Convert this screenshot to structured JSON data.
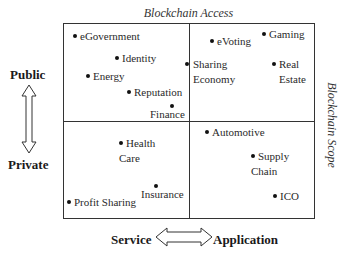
{
  "diagram": {
    "top_title": "Blockchain Access",
    "right_title": "Blockchain Scope",
    "vertical_axis": {
      "top": "Public",
      "bottom": "Private",
      "arrow": "double-vertical-arrow"
    },
    "horizontal_axis": {
      "left": "Service",
      "right": "Application",
      "arrow": "double-horizontal-arrow"
    },
    "quadrants": {
      "public_service": [
        "eGovernment",
        "Identity",
        "Energy",
        "Reputation",
        "Finance"
      ],
      "public_application": [
        "eVoting",
        "Gaming",
        "Sharing Economy",
        "Real Estate"
      ],
      "private_service": [
        "Health Care",
        "Insurance",
        "Profit Sharing"
      ],
      "private_application": [
        "Automotive",
        "Supply Chain",
        "ICO"
      ]
    },
    "items": {
      "egovernment": "eGovernment",
      "identity": "Identity",
      "energy": "Energy",
      "reputation": "Reputation",
      "finance": "Finance",
      "evoting": "eVoting",
      "gaming": "Gaming",
      "sharing_1": "Sharing",
      "sharing_2": "Economy",
      "realestate_1": "Real",
      "realestate_2": "Estate",
      "health_1": "Health",
      "health_2": "Care",
      "insurance": "Insurance",
      "profit": "Profit Sharing",
      "automotive": "Automotive",
      "supply_1": "Supply",
      "supply_2": "Chain",
      "ico": "ICO"
    }
  }
}
